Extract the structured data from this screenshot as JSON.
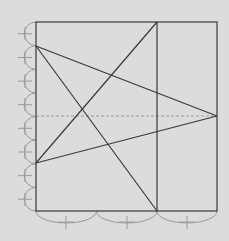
{
  "diagram": {
    "background": "#dcdcdc",
    "line_color": "#3a3a3a",
    "guide_color": "#9a9a9a",
    "square": {
      "x": 36,
      "y": 22,
      "w": 181,
      "h": 189
    },
    "vertical_divider_x": 157,
    "dashed_midline_y": 116,
    "points": {
      "top_corner_left": [
        36,
        22
      ],
      "upper_left": [
        36,
        46
      ],
      "lower_left": [
        36,
        163
      ],
      "right_mid": [
        217,
        116
      ],
      "top_divider": [
        157,
        22
      ],
      "bottom_divider": [
        157,
        211
      ]
    },
    "left_arc_count": 8,
    "bottom_arc_count": 3
  }
}
